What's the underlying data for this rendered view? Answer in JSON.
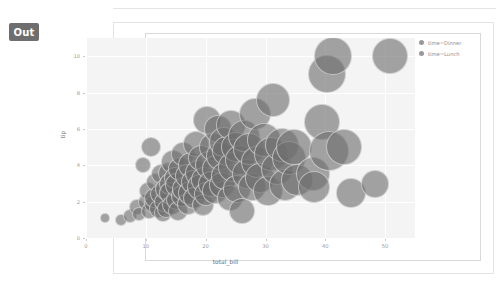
{
  "notebook": {
    "output_badge": "Out",
    "badge_color": "#6e6e6e"
  },
  "chart_data": {
    "type": "scatter",
    "title": "",
    "subtitle": "",
    "xlabel": "total_bill",
    "ylabel": "tip",
    "xlim": [
      0,
      55
    ],
    "ylim": [
      0,
      11
    ],
    "xticks": [
      0,
      10,
      20,
      30,
      40,
      50
    ],
    "yticks": [
      0,
      2,
      4,
      6,
      8,
      10
    ],
    "grid": true,
    "grid_color": "#ffffff",
    "panel_background": "#f4f4f4",
    "marker_color": "#6e6e6e",
    "marker_opacity": 0.62,
    "size_encoding": "size",
    "legend": {
      "position": "right",
      "entries": [
        {
          "label": "time=Dinner",
          "color": "#6e6e6e"
        },
        {
          "label": "time=Lunch",
          "color": "#6e6e6e"
        }
      ]
    },
    "points": [
      {
        "x": 3.1,
        "y": 1.1,
        "s": 5
      },
      {
        "x": 5.8,
        "y": 1.0,
        "s": 6
      },
      {
        "x": 7.3,
        "y": 1.2,
        "s": 7
      },
      {
        "x": 8.5,
        "y": 1.7,
        "s": 8
      },
      {
        "x": 8.8,
        "y": 1.3,
        "s": 7
      },
      {
        "x": 9.6,
        "y": 4.0,
        "s": 8
      },
      {
        "x": 10.1,
        "y": 2.0,
        "s": 8
      },
      {
        "x": 10.3,
        "y": 2.6,
        "s": 9
      },
      {
        "x": 10.6,
        "y": 1.5,
        "s": 8
      },
      {
        "x": 10.8,
        "y": 5.0,
        "s": 10
      },
      {
        "x": 11.2,
        "y": 1.9,
        "s": 9
      },
      {
        "x": 11.4,
        "y": 2.2,
        "s": 10
      },
      {
        "x": 11.6,
        "y": 3.1,
        "s": 9
      },
      {
        "x": 12.0,
        "y": 1.6,
        "s": 9
      },
      {
        "x": 12.3,
        "y": 2.4,
        "s": 10
      },
      {
        "x": 12.5,
        "y": 3.5,
        "s": 10
      },
      {
        "x": 12.9,
        "y": 1.4,
        "s": 9
      },
      {
        "x": 13.0,
        "y": 2.0,
        "s": 10
      },
      {
        "x": 13.3,
        "y": 2.7,
        "s": 11
      },
      {
        "x": 13.4,
        "y": 1.6,
        "s": 9
      },
      {
        "x": 13.8,
        "y": 3.6,
        "s": 11
      },
      {
        "x": 14.0,
        "y": 3.0,
        "s": 11
      },
      {
        "x": 14.1,
        "y": 2.5,
        "s": 11
      },
      {
        "x": 14.3,
        "y": 1.8,
        "s": 10
      },
      {
        "x": 14.5,
        "y": 4.2,
        "s": 12
      },
      {
        "x": 14.8,
        "y": 3.3,
        "s": 11
      },
      {
        "x": 15.0,
        "y": 2.1,
        "s": 10
      },
      {
        "x": 15.2,
        "y": 2.9,
        "s": 12
      },
      {
        "x": 15.4,
        "y": 1.5,
        "s": 10
      },
      {
        "x": 15.7,
        "y": 3.8,
        "s": 12
      },
      {
        "x": 16.0,
        "y": 2.3,
        "s": 11
      },
      {
        "x": 16.2,
        "y": 4.6,
        "s": 12
      },
      {
        "x": 16.4,
        "y": 2.7,
        "s": 12
      },
      {
        "x": 16.8,
        "y": 3.4,
        "s": 12
      },
      {
        "x": 17.0,
        "y": 1.9,
        "s": 11
      },
      {
        "x": 17.3,
        "y": 2.5,
        "s": 12
      },
      {
        "x": 17.6,
        "y": 4.0,
        "s": 13
      },
      {
        "x": 17.9,
        "y": 3.1,
        "s": 12
      },
      {
        "x": 18.1,
        "y": 2.2,
        "s": 11
      },
      {
        "x": 18.4,
        "y": 5.2,
        "s": 13
      },
      {
        "x": 18.7,
        "y": 3.6,
        "s": 13
      },
      {
        "x": 19.0,
        "y": 2.8,
        "s": 13
      },
      {
        "x": 19.3,
        "y": 4.4,
        "s": 13
      },
      {
        "x": 19.6,
        "y": 1.8,
        "s": 11
      },
      {
        "x": 19.8,
        "y": 3.2,
        "s": 13
      },
      {
        "x": 20.1,
        "y": 2.4,
        "s": 12
      },
      {
        "x": 20.3,
        "y": 6.5,
        "s": 14
      },
      {
        "x": 20.6,
        "y": 4.0,
        "s": 14
      },
      {
        "x": 20.9,
        "y": 3.0,
        "s": 13
      },
      {
        "x": 21.2,
        "y": 5.0,
        "s": 14
      },
      {
        "x": 21.5,
        "y": 2.6,
        "s": 13
      },
      {
        "x": 21.8,
        "y": 3.8,
        "s": 14
      },
      {
        "x": 22.0,
        "y": 6.0,
        "s": 14
      },
      {
        "x": 22.4,
        "y": 4.5,
        "s": 14
      },
      {
        "x": 22.7,
        "y": 2.9,
        "s": 13
      },
      {
        "x": 23.0,
        "y": 5.3,
        "s": 15
      },
      {
        "x": 23.3,
        "y": 3.4,
        "s": 14
      },
      {
        "x": 23.6,
        "y": 4.8,
        "s": 15
      },
      {
        "x": 24.0,
        "y": 2.2,
        "s": 13
      },
      {
        "x": 24.3,
        "y": 6.2,
        "s": 15
      },
      {
        "x": 24.6,
        "y": 3.9,
        "s": 15
      },
      {
        "x": 25.0,
        "y": 5.0,
        "s": 15
      },
      {
        "x": 25.3,
        "y": 2.7,
        "s": 14
      },
      {
        "x": 25.7,
        "y": 4.3,
        "s": 15
      },
      {
        "x": 26.0,
        "y": 1.5,
        "s": 13
      },
      {
        "x": 26.4,
        "y": 5.6,
        "s": 16
      },
      {
        "x": 26.9,
        "y": 3.5,
        "s": 15
      },
      {
        "x": 27.2,
        "y": 4.9,
        "s": 16
      },
      {
        "x": 27.8,
        "y": 2.8,
        "s": 14
      },
      {
        "x": 28.2,
        "y": 6.8,
        "s": 16
      },
      {
        "x": 28.6,
        "y": 4.2,
        "s": 16
      },
      {
        "x": 29.0,
        "y": 3.3,
        "s": 15
      },
      {
        "x": 29.8,
        "y": 5.4,
        "s": 17
      },
      {
        "x": 30.4,
        "y": 2.6,
        "s": 15
      },
      {
        "x": 30.9,
        "y": 4.6,
        "s": 17
      },
      {
        "x": 31.3,
        "y": 7.6,
        "s": 17
      },
      {
        "x": 32.0,
        "y": 3.8,
        "s": 16
      },
      {
        "x": 32.7,
        "y": 5.1,
        "s": 17
      },
      {
        "x": 33.2,
        "y": 2.9,
        "s": 16
      },
      {
        "x": 34.0,
        "y": 4.4,
        "s": 17
      },
      {
        "x": 34.8,
        "y": 5.0,
        "s": 18
      },
      {
        "x": 35.3,
        "y": 3.2,
        "s": 16
      },
      {
        "x": 38.0,
        "y": 3.5,
        "s": 17
      },
      {
        "x": 38.1,
        "y": 2.8,
        "s": 16
      },
      {
        "x": 39.4,
        "y": 6.4,
        "s": 18
      },
      {
        "x": 40.2,
        "y": 9.0,
        "s": 19
      },
      {
        "x": 40.6,
        "y": 4.8,
        "s": 20
      },
      {
        "x": 41.2,
        "y": 10.0,
        "s": 19
      },
      {
        "x": 43.1,
        "y": 5.0,
        "s": 18
      },
      {
        "x": 44.3,
        "y": 2.5,
        "s": 15
      },
      {
        "x": 48.3,
        "y": 3.0,
        "s": 14
      },
      {
        "x": 50.8,
        "y": 10.0,
        "s": 18
      }
    ]
  }
}
